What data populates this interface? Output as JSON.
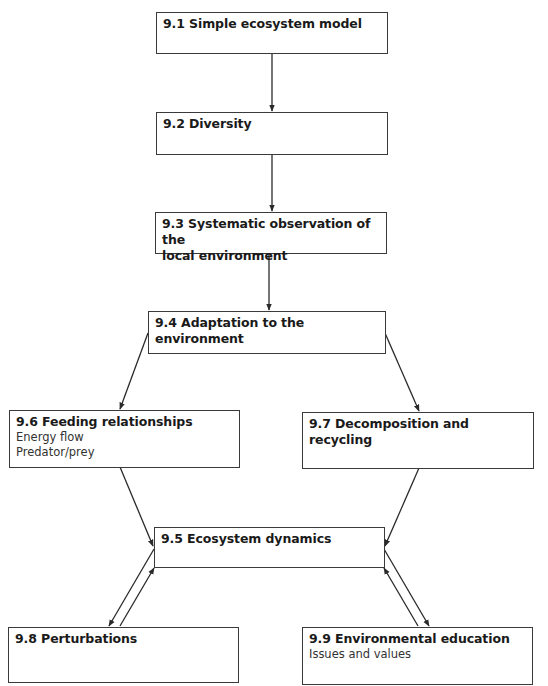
{
  "diagram": {
    "nodes": [
      {
        "id": "9.1",
        "title": "9.1 Simple ecosystem model",
        "lines": []
      },
      {
        "id": "9.2",
        "title": "9.2 Diversity",
        "lines": []
      },
      {
        "id": "9.3",
        "title": "9.3 Systematic observation of the local environment",
        "title_line1": "9.3 Systematic observation of the",
        "title_line2": "local environment",
        "lines": []
      },
      {
        "id": "9.4",
        "title": "9.4 Adaptation to the environment",
        "lines": []
      },
      {
        "id": "9.6",
        "title": "9.6 Feeding relationships",
        "lines": [
          "Energy flow",
          "Predator/prey"
        ]
      },
      {
        "id": "9.7",
        "title": "9.7 Decomposition and recycling",
        "lines": []
      },
      {
        "id": "9.5",
        "title": "9.5 Ecosystem dynamics",
        "lines": []
      },
      {
        "id": "9.8",
        "title": "9.8 Perturbations",
        "lines": []
      },
      {
        "id": "9.9",
        "title": "9.9 Environmental education",
        "lines": [
          "Issues and values"
        ]
      }
    ],
    "edges": [
      {
        "from": "9.1",
        "to": "9.2"
      },
      {
        "from": "9.2",
        "to": "9.3"
      },
      {
        "from": "9.3",
        "to": "9.4"
      },
      {
        "from": "9.4",
        "to": "9.6"
      },
      {
        "from": "9.4",
        "to": "9.7"
      },
      {
        "from": "9.6",
        "to": "9.5"
      },
      {
        "from": "9.7",
        "to": "9.5"
      },
      {
        "from": "9.5",
        "to": "9.8"
      },
      {
        "from": "9.8",
        "to": "9.5"
      },
      {
        "from": "9.5",
        "to": "9.9"
      },
      {
        "from": "9.9",
        "to": "9.5"
      }
    ],
    "colors": {
      "border": "#3a3a3a",
      "arrow": "#2a2a2a",
      "text": "#1a1a1a",
      "background": "#ffffff"
    }
  }
}
